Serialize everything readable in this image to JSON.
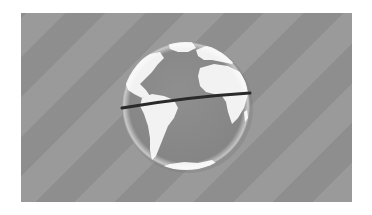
{
  "scene": {
    "description": "Grayscale globe showing the Americas, Africa and Europe with a dark equator band on a diagonally striped gray background",
    "colors": {
      "page_background": "#ffffff",
      "panel_background": "#939393",
      "stripe_light": "#9a9a9a",
      "stripe_dark": "#8e8e8e",
      "ocean": "#8a8a8a",
      "land": "#f2f2f2",
      "equator_band": "#2a2a2a",
      "rim_highlight": "#e6e6e6"
    },
    "globe": {
      "cx": 186,
      "cy": 106,
      "r": 64
    },
    "equator": {
      "x1": 122,
      "y1": 108,
      "x2": 250,
      "y2": 93
    }
  }
}
